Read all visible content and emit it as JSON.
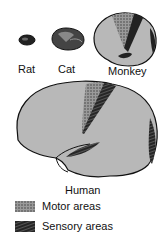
{
  "figure": {
    "species": [
      {
        "label": "Rat"
      },
      {
        "label": "Cat"
      },
      {
        "label": "Monkey"
      },
      {
        "label": "Human"
      }
    ],
    "legend": [
      {
        "label": "Motor areas",
        "pattern": "stippled"
      },
      {
        "label": "Sensory areas",
        "pattern": "hatched"
      }
    ],
    "colors": {
      "cortex": "#b8b8b8",
      "outline": "#111111",
      "motor": "#7a7a7a",
      "sensory": "#222222"
    }
  }
}
